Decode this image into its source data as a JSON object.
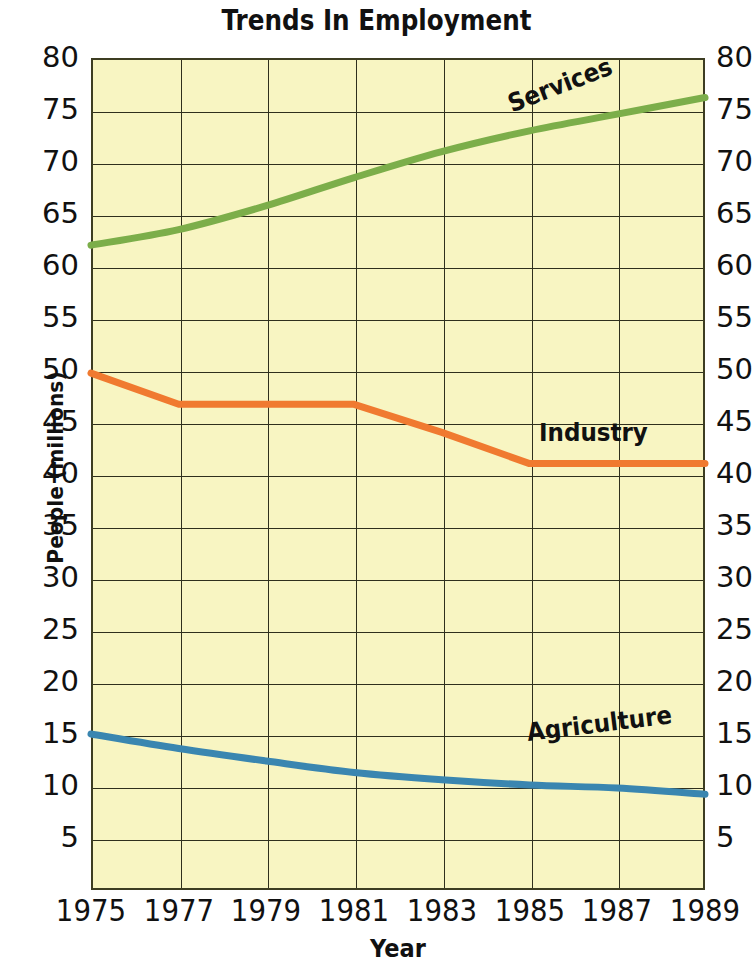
{
  "title": "Trends In Employment",
  "axes": {
    "x_title": "Year",
    "y_title": "People  (millions)"
  },
  "colors": {
    "plot_background": "#F8F5C2",
    "grid": "#2f2f1c",
    "services": "#7CAE4A",
    "industry": "#F07A30",
    "agriculture": "#3A86B0",
    "text": "#111111"
  },
  "series_labels": {
    "services": "Services",
    "industry": "Industry",
    "agriculture": "Agriculture"
  },
  "chart_data": {
    "type": "line",
    "title": "Trends In Employment",
    "xlabel": "Year",
    "ylabel": "People  (millions)",
    "xlim": [
      1975,
      1989
    ],
    "ylim": [
      0,
      80
    ],
    "xticks": [
      1975,
      1977,
      1979,
      1981,
      1983,
      1985,
      1987,
      1989
    ],
    "yticks": [
      5,
      10,
      15,
      20,
      25,
      30,
      35,
      40,
      45,
      50,
      55,
      60,
      65,
      70,
      75,
      80
    ],
    "grid": true,
    "dual_y_axis": true,
    "legend": "inline-labels",
    "x": [
      1975,
      1977,
      1979,
      1981,
      1983,
      1985,
      1987,
      1989
    ],
    "series": [
      {
        "name": "Services",
        "color": "#7CAE4A",
        "values": [
          62.0,
          63.5,
          65.8,
          68.5,
          71.0,
          73.0,
          74.6,
          76.2
        ]
      },
      {
        "name": "Industry",
        "color": "#F07A30",
        "values": [
          49.7,
          46.7,
          46.7,
          46.7,
          44.0,
          41.0,
          41.0,
          41.0
        ]
      },
      {
        "name": "Agriculture",
        "color": "#3A86B0",
        "values": [
          15.0,
          13.6,
          12.4,
          11.3,
          10.6,
          10.1,
          9.8,
          9.2
        ]
      }
    ]
  }
}
